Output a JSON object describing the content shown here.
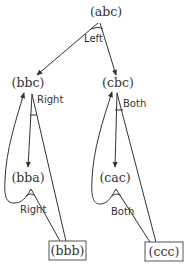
{
  "diagram": {
    "type": "state-transition-graph",
    "nodes": [
      {
        "id": "abc",
        "label": "(abc)",
        "boxed": false
      },
      {
        "id": "bbc",
        "label": "(bbc)",
        "boxed": false
      },
      {
        "id": "cbc",
        "label": "(cbc)",
        "boxed": false
      },
      {
        "id": "bba",
        "label": "(bba)",
        "boxed": false
      },
      {
        "id": "cac",
        "label": "(cac)",
        "boxed": false
      },
      {
        "id": "bbb",
        "label": "(bbb)",
        "boxed": true
      },
      {
        "id": "ccc",
        "label": "(ccc)",
        "boxed": true
      }
    ],
    "edges": [
      {
        "from": "abc",
        "to": "bbc",
        "group": "Left"
      },
      {
        "from": "abc",
        "to": "cbc",
        "group": "Left"
      },
      {
        "from": "bbc",
        "to": "bba",
        "group": "Right"
      },
      {
        "from": "bbc",
        "to": "bbb",
        "group": "Right"
      },
      {
        "from": "bba",
        "to": "bbc",
        "group": "Right"
      },
      {
        "from": "bba",
        "to": "bbb",
        "group": "Right"
      },
      {
        "from": "cbc",
        "to": "cac",
        "group": "Both"
      },
      {
        "from": "cbc",
        "to": "ccc",
        "group": "Both"
      },
      {
        "from": "cac",
        "to": "cbc",
        "group": "Both"
      },
      {
        "from": "cac",
        "to": "ccc",
        "group": "Both"
      }
    ],
    "edge_labels": {
      "abc_out": "Left",
      "bbc_out": "Right",
      "cbc_out": "Both",
      "bba_out": "Right",
      "cac_out": "Both"
    },
    "colors": {
      "line": "#333333",
      "text": "#333333",
      "box_border": "#555555",
      "background": "#ffffff"
    }
  }
}
